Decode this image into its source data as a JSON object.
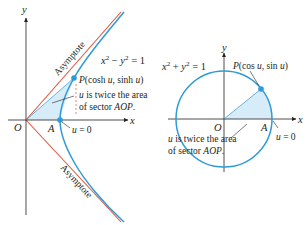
{
  "left_panel": {
    "name": "hyperbola",
    "equation": "x² − y² = 1",
    "point_label": "P(cosh u, sinh u)",
    "point_label_parts": {
      "P": "P",
      "rest": "(cosh u, sinh u)"
    },
    "annotation_line1": "u is twice the area",
    "annotation_line2": "of sector AOP.",
    "asymptote_top": "Asymptote",
    "asymptote_bottom": "Asymptote",
    "origin": "O",
    "vertex": "A",
    "u_zero": "u = 0",
    "axis_x": "x",
    "axis_y": "y"
  },
  "right_panel": {
    "name": "unit-circle",
    "equation": "x² + y² = 1",
    "point_label": "P(cos u, sin u)",
    "annotation_line1": "u is twice the area",
    "annotation_line2": "of sector AOP.",
    "origin": "O",
    "vertex": "A",
    "u_zero": "u = 0",
    "axis_x": "x",
    "axis_y": "y"
  },
  "colors": {
    "curve": "#2e9ad6",
    "asymptote": "#e0533a",
    "sector_fill": "#d6ecf8",
    "axis": "#231f20",
    "leader": "#231f20"
  }
}
